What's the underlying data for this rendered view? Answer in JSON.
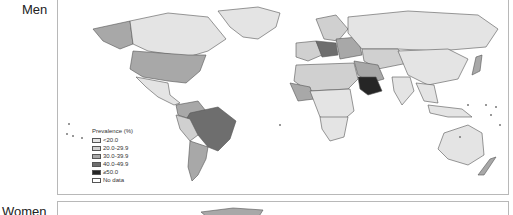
{
  "panels": [
    {
      "label": "Men"
    },
    {
      "label": "Women"
    }
  ],
  "legend": {
    "title": "Prevalence (%)",
    "items": [
      {
        "label": "<20.0",
        "color": "#e4e4e4"
      },
      {
        "label": "20.0-29.9",
        "color": "#d0d0d0"
      },
      {
        "label": "30.0-39.9",
        "color": "#a8a8a8"
      },
      {
        "label": "40.0-49.9",
        "color": "#6e6e6e"
      },
      {
        "label": "≥50.0",
        "color": "#262626"
      },
      {
        "label": "No data",
        "color": "#ffffff"
      }
    ]
  },
  "colors": {
    "border": "#555555",
    "frame": "#b8b8b8"
  }
}
